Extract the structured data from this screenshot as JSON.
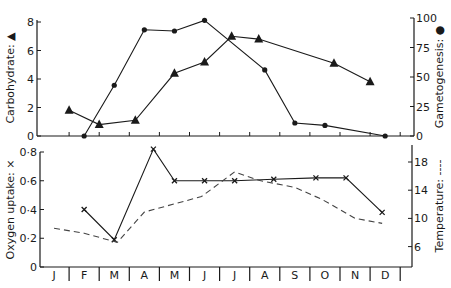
{
  "chart_data": [
    {
      "type": "line",
      "panel": "upper",
      "title": "",
      "xlabel": "",
      "categories": [
        "J",
        "F",
        "M",
        "A",
        "M",
        "J",
        "J",
        "A",
        "S",
        "O",
        "N",
        "D"
      ],
      "left_axis": {
        "label": "Carbohydrate: ▲",
        "ticks": [
          "0",
          "2",
          "4",
          "6",
          "8"
        ],
        "ylim": [
          0,
          8
        ]
      },
      "right_axis": {
        "label": "Gametogenesis: ●",
        "ticks": [
          "0",
          "25",
          "50",
          "75",
          "100"
        ],
        "ylim": [
          0,
          100
        ]
      },
      "series": [
        {
          "name": "Carbohydrate",
          "marker": "triangle",
          "axis": "left",
          "points": [
            {
              "month": 1.0,
              "value": 1.8
            },
            {
              "month": 2.0,
              "value": 0.8
            },
            {
              "month": 3.2,
              "value": 1.1
            },
            {
              "month": 4.5,
              "value": 4.4
            },
            {
              "month": 5.5,
              "value": 5.2
            },
            {
              "month": 6.4,
              "value": 7.0
            },
            {
              "month": 7.3,
              "value": 6.8
            },
            {
              "month": 9.8,
              "value": 5.1
            },
            {
              "month": 11.0,
              "value": 3.8
            }
          ]
        },
        {
          "name": "Gametogenesis",
          "marker": "dot",
          "axis": "right",
          "points": [
            {
              "month": 1.5,
              "value": 0
            },
            {
              "month": 2.5,
              "value": 43
            },
            {
              "month": 3.5,
              "value": 90
            },
            {
              "month": 4.5,
              "value": 89
            },
            {
              "month": 5.5,
              "value": 98
            },
            {
              "month": 7.5,
              "value": 56
            },
            {
              "month": 8.5,
              "value": 11
            },
            {
              "month": 9.5,
              "value": 9
            },
            {
              "month": 11.5,
              "value": 0
            }
          ]
        }
      ],
      "grid": false
    },
    {
      "type": "line",
      "panel": "lower",
      "title": "",
      "xlabel": "Month",
      "categories": [
        "J",
        "F",
        "M",
        "A",
        "M",
        "J",
        "J",
        "A",
        "S",
        "O",
        "N",
        "D"
      ],
      "left_axis": {
        "label": "Oxygen uptake: ×",
        "ticks": [
          "0",
          "0·2",
          "0·4",
          "0·6",
          "0·8"
        ],
        "ylim": [
          0,
          0.8
        ]
      },
      "right_axis": {
        "label": "Temperature: ----",
        "ticks": [
          "6",
          "10",
          "14",
          "18"
        ],
        "ylim": [
          4,
          19
        ]
      },
      "series": [
        {
          "name": "Oxygen uptake",
          "marker": "x",
          "axis": "left",
          "points": [
            {
              "month": 1.5,
              "value": 0.4
            },
            {
              "month": 2.5,
              "value": 0.19
            },
            {
              "month": 3.8,
              "value": 0.82
            },
            {
              "month": 4.5,
              "value": 0.6
            },
            {
              "month": 5.5,
              "value": 0.6
            },
            {
              "month": 6.5,
              "value": 0.6
            },
            {
              "month": 7.8,
              "value": 0.61
            },
            {
              "month": 9.2,
              "value": 0.62
            },
            {
              "month": 10.2,
              "value": 0.62
            },
            {
              "month": 11.4,
              "value": 0.38
            }
          ]
        },
        {
          "name": "Temperature",
          "style": "dashed",
          "axis": "right",
          "points": [
            {
              "month": 0.5,
              "value": 8.6
            },
            {
              "month": 1.5,
              "value": 7.9
            },
            {
              "month": 2.6,
              "value": 6.6
            },
            {
              "month": 3.5,
              "value": 10.9
            },
            {
              "month": 5.4,
              "value": 13.1
            },
            {
              "month": 6.5,
              "value": 16.6
            },
            {
              "month": 7.3,
              "value": 15.4
            },
            {
              "month": 8.5,
              "value": 14.4
            },
            {
              "month": 9.4,
              "value": 12.7
            },
            {
              "month": 10.5,
              "value": 10.0
            },
            {
              "month": 11.4,
              "value": 9.3
            }
          ]
        }
      ],
      "grid": false
    }
  ]
}
